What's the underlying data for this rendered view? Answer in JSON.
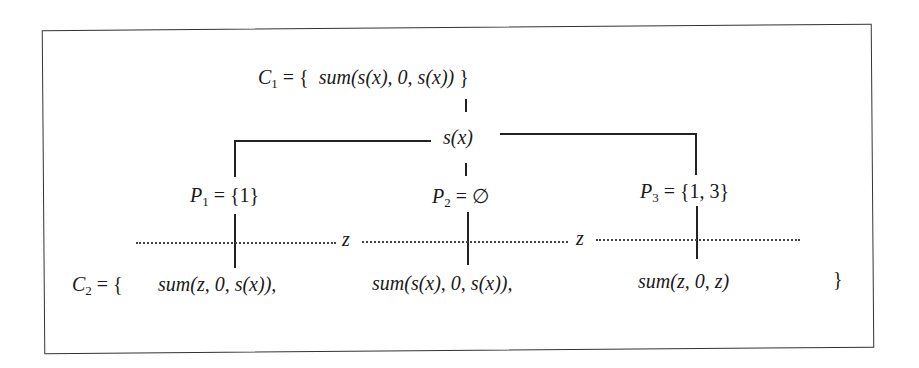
{
  "diagram": {
    "top_set": {
      "name": "C",
      "subscript": "1",
      "prefix": "= {",
      "elements": [
        "sum(s(x), 0, s(x))"
      ],
      "suffix": "}"
    },
    "branch_node": "s(x)",
    "partitions": [
      {
        "name": "P",
        "subscript": "1",
        "value": "= {1}"
      },
      {
        "name": "P",
        "subscript": "2",
        "value": "= ∅"
      },
      {
        "name": "P",
        "subscript": "3",
        "value": "= {1, 3}"
      }
    ],
    "separator_labels": [
      "z",
      "z"
    ],
    "bottom_set": {
      "name": "C",
      "subscript": "2",
      "prefix": "= {",
      "elements": [
        "sum(z, 0, s(x)),",
        "sum(s(x), 0, s(x)),",
        "sum(z, 0, z)"
      ],
      "suffix": "}"
    }
  }
}
